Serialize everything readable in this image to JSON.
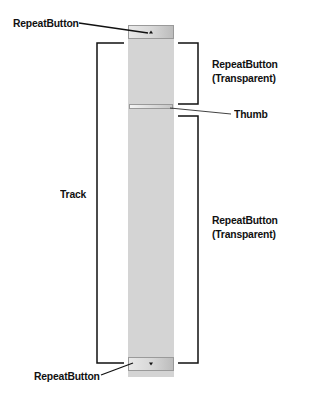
{
  "labels": {
    "top_button": "RepeatButton",
    "upper_transparent_line1": "RepeatButton",
    "upper_transparent_line2": "(Transparent)",
    "thumb": "Thumb",
    "track": "Track",
    "lower_transparent_line1": "RepeatButton",
    "lower_transparent_line2": "(Transparent)",
    "bottom_button": "RepeatButton"
  },
  "icons": {
    "top_arrow": "arrow-up-icon",
    "bottom_arrow": "arrow-down-icon"
  },
  "colors": {
    "track": "#d4d4d4",
    "lines": "#111111"
  }
}
